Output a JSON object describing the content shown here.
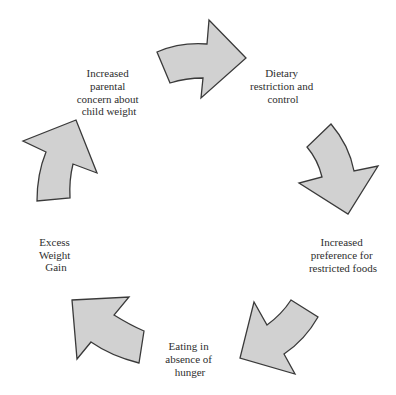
{
  "diagram": {
    "type": "cycle",
    "colors": {
      "background": "#ffffff",
      "arrow_fill": "#d1d1d1",
      "arrow_stroke": "#3a3a3a",
      "text": "#2e2e2e"
    },
    "nodes": [
      {
        "id": "parental-concern",
        "label": "Increased parental concern about child weight",
        "lines": [
          "Increased",
          "parental",
          "concern about",
          "child weight"
        ]
      },
      {
        "id": "dietary-restriction",
        "label": "Dietary restriction and control",
        "lines": [
          "Dietary",
          "restriction and",
          "control"
        ]
      },
      {
        "id": "preference-restricted",
        "label": "Increased preference for restricted foods",
        "lines": [
          "Increased",
          "preference for",
          "restricted foods"
        ]
      },
      {
        "id": "eating-absence-hunger",
        "label": "Eating in absence of hunger",
        "lines": [
          "Eating in",
          "absence of",
          "hunger"
        ]
      },
      {
        "id": "excess-weight-gain",
        "label": "Excess Weight Gain",
        "lines": [
          "Excess",
          "Weight",
          "Gain"
        ]
      }
    ],
    "edges": [
      {
        "from": "parental-concern",
        "to": "dietary-restriction"
      },
      {
        "from": "dietary-restriction",
        "to": "preference-restricted"
      },
      {
        "from": "preference-restricted",
        "to": "eating-absence-hunger"
      },
      {
        "from": "eating-absence-hunger",
        "to": "excess-weight-gain"
      },
      {
        "from": "excess-weight-gain",
        "to": "parental-concern"
      }
    ]
  }
}
